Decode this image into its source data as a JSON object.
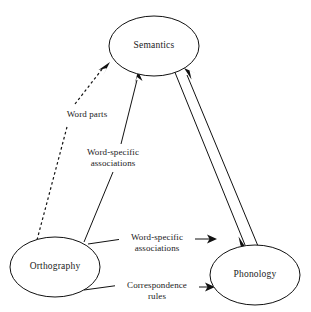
{
  "diagram": {
    "background_color": "#ffffff",
    "line_color": "#111111",
    "nodes": [
      {
        "id": "semantics",
        "label": "Semantics",
        "cx": 154,
        "cy": 46,
        "rx": 45,
        "ry": 30
      },
      {
        "id": "orthography",
        "label": "Orthography",
        "cx": 55,
        "cy": 267,
        "rx": 45,
        "ry": 30
      },
      {
        "id": "phonology",
        "label": "Phonology",
        "cx": 255,
        "cy": 275,
        "rx": 45,
        "ry": 30
      }
    ],
    "edges": [
      {
        "id": "orthography-to-semantics-word-parts",
        "from": "orthography",
        "to": "semantics",
        "style": "dashed",
        "arrow": "to-semantics",
        "label": "Word parts"
      },
      {
        "id": "orthography-to-semantics-associations",
        "from": "orthography",
        "to": "semantics",
        "style": "solid",
        "arrow": "to-semantics",
        "label_line1": "Word-specific",
        "label_line2": "associations"
      },
      {
        "id": "orthography-to-phonology-associations",
        "from": "orthography",
        "to": "phonology",
        "style": "solid",
        "arrow": "to-phonology",
        "label_line1": "Word-specific",
        "label_line2": "associations"
      },
      {
        "id": "orthography-to-phonology-correspondence",
        "from": "orthography",
        "to": "phonology",
        "style": "solid",
        "arrow": "to-phonology",
        "label_line1": "Correspondence",
        "label_line2": "rules"
      },
      {
        "id": "semantics-to-phonology",
        "from": "semantics",
        "to": "phonology",
        "style": "solid",
        "arrow": "to-phonology",
        "label": ""
      },
      {
        "id": "phonology-to-semantics",
        "from": "phonology",
        "to": "semantics",
        "style": "solid",
        "arrow": "to-semantics",
        "label": ""
      }
    ],
    "labels": {
      "word_parts": "Word parts",
      "word_specific_upper_line1": "Word-specific",
      "word_specific_upper_line2": "associations",
      "word_specific_mid_line1": "Word-specific",
      "word_specific_mid_line2": "associations",
      "correspondence_line1": "Correspondence",
      "correspondence_line2": "rules"
    }
  }
}
